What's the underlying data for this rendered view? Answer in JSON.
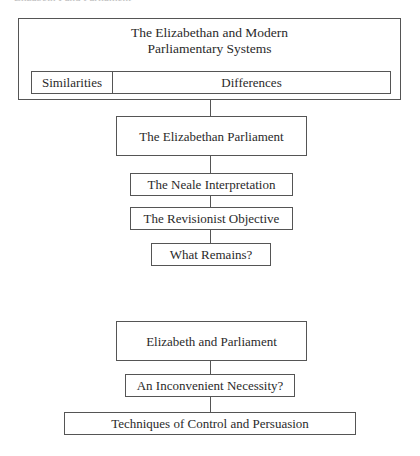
{
  "running_header": "Elizabeth I and Parliament",
  "top_section": {
    "title_line1": "The Elizabethan and Modern",
    "title_line2": "Parliamentary Systems",
    "row": {
      "left": "Similarities",
      "right": "Differences"
    }
  },
  "chain1": {
    "main": "The Elizabethan Parliament",
    "items": [
      "The Neale Interpretation",
      "The Revisionist Objective",
      "What Remains?"
    ]
  },
  "chain2": {
    "main": "Elizabeth and Parliament",
    "items": [
      "An Inconvenient Necessity?",
      "Techniques of Control and Persuasion"
    ]
  }
}
